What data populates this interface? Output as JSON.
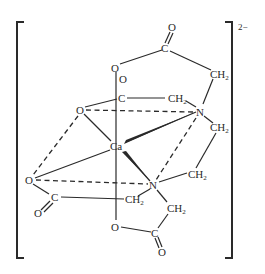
{
  "diagram": {
    "charge": "2−",
    "atoms": {
      "ca": "Ca",
      "n1": "N",
      "n2": "N",
      "o_top_carbonyl": "O",
      "c_top": "C",
      "o_top_ester": "O",
      "ch2_top": "CH",
      "o_mid_carbonyl": "O",
      "c_mid": "C",
      "ch2_mid": "CH",
      "ch2_bridge_upper": "CH",
      "o_left_upper": "O",
      "o_left_lower": "O",
      "c_left": "C",
      "o_left_carbonyl": "O",
      "ch2_left": "CH",
      "ch2_bridge_lower": "CH",
      "ch2_bottom": "CH",
      "o_bottom_ester": "O",
      "c_bottom": "C",
      "o_bottom_carbonyl": "O"
    },
    "subscript": "2"
  }
}
